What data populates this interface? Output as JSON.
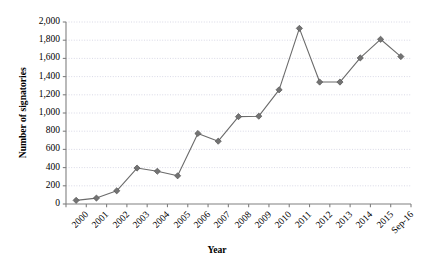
{
  "chart_data": {
    "type": "line",
    "title": "",
    "xlabel": "Year",
    "ylabel": "Number of signatories",
    "categories": [
      "2000",
      "2001",
      "2002",
      "2003",
      "2004",
      "2005",
      "2006",
      "2007",
      "2008",
      "2009",
      "2010",
      "2011",
      "2012",
      "2013",
      "2014",
      "2015",
      "Sep-16"
    ],
    "values": [
      40,
      65,
      145,
      395,
      360,
      310,
      775,
      690,
      960,
      965,
      1255,
      1930,
      1340,
      1340,
      1605,
      1810,
      1620
    ],
    "ylim": [
      0,
      2000
    ],
    "ytick_labels": [
      "0",
      "200",
      "400",
      "600",
      "800",
      "1,000",
      "1,200",
      "1,400",
      "1,600",
      "1,800",
      "2,000"
    ],
    "ytick_values": [
      0,
      200,
      400,
      600,
      800,
      1000,
      1200,
      1400,
      1600,
      1800,
      2000
    ],
    "grid": true,
    "grid_style": "dotted-horizontal",
    "legend": "none",
    "series_color": "#6b6b6b",
    "marker": "diamond",
    "marker_color": "#737373",
    "axis_color": "#808080",
    "grid_color": "#cfcfe0"
  }
}
